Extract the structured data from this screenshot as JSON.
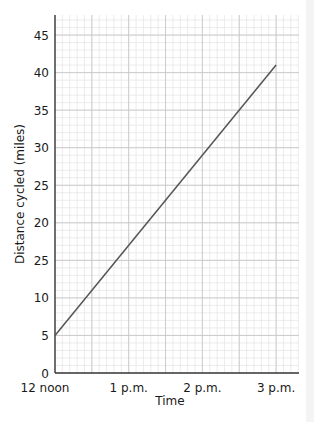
{
  "chart_data": {
    "type": "line",
    "title": "",
    "xlabel": "Time",
    "ylabel": "Distance cycled (miles)",
    "x_tick_labels": [
      "12 noon",
      "1 p.m.",
      "2 p.m.",
      "3 p.m."
    ],
    "y_tick_labels": [
      "0",
      "5",
      "10",
      "25",
      "20",
      "25",
      "30",
      "35",
      "40",
      "45"
    ],
    "y_tick_values": [
      0,
      5,
      10,
      15,
      20,
      25,
      30,
      35,
      40,
      45
    ],
    "xlim_hours": [
      0,
      3.3
    ],
    "ylim": [
      0,
      47
    ],
    "grid": true,
    "legend": null,
    "series": [
      {
        "name": "Distance cycled",
        "x": [
          "12 noon",
          "3 p.m."
        ],
        "x_hours": [
          0,
          3
        ],
        "values": [
          5,
          41
        ]
      }
    ],
    "colors": {
      "line": "#555555",
      "axis": "#333333",
      "grid_major": "#c8c8c8",
      "grid_minor": "#e4e4e4"
    }
  }
}
